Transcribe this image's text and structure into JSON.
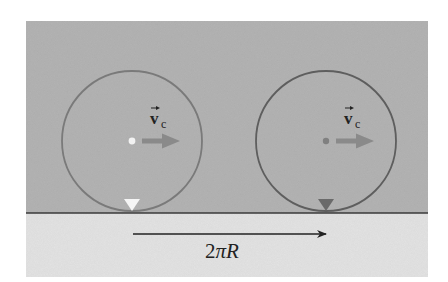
{
  "diagram": {
    "colors": {
      "background": "#ffffff",
      "sky": "#b4b4b4",
      "ground": "#e4e4e4",
      "ground_line": "#3a3a3a",
      "wheel_rim": "#7a7a7a",
      "wheel_rim_right": "#5e5e5e",
      "velocity_arrow": "#8a8a8a",
      "center_dot_left": "#f2f2f2",
      "center_dot_right": "#808080",
      "marker_left": "#f5f5f5",
      "marker_right": "#6a6a6a",
      "distance_arrow": "#222222"
    },
    "wheels": [
      {
        "id": "left",
        "center_x": 132,
        "center_y": 141,
        "radius": 70,
        "velocity_label": "v",
        "velocity_subscript": "c",
        "marker": "contact-point-marker-start"
      },
      {
        "id": "right",
        "center_x": 326,
        "center_y": 141,
        "radius": 70,
        "velocity_label": "v",
        "velocity_subscript": "c",
        "marker": "contact-point-marker-end"
      }
    ],
    "distance_label": {
      "coefficient": "2",
      "symbol": "π",
      "variable": "R"
    }
  }
}
